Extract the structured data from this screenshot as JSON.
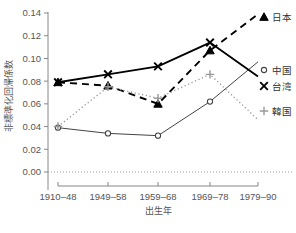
{
  "chart_data": {
    "type": "line",
    "title": "",
    "xlabel": "出生年",
    "ylabel": "非標準化回帰係数",
    "categories": [
      "1910–48",
      "1949–58",
      "1959–68",
      "1969–78",
      "1979–90"
    ],
    "yticks": [
      "0.00",
      "0.02",
      "0.04",
      "0.06",
      "0.08",
      "0.10",
      "0.12",
      "0.14"
    ],
    "ytick_values": [
      0.0,
      0.02,
      0.04,
      0.06,
      0.08,
      0.1,
      0.12,
      0.14
    ],
    "ylim": [
      0.0,
      0.145
    ],
    "grid": false,
    "zero_reference_line": 0.0,
    "legend_position": "right",
    "series": [
      {
        "name": "日本",
        "marker": "triangle",
        "line_style": "dashed",
        "color": "#000000",
        "values": [
          0.079,
          0.076,
          0.06,
          0.107,
          0.139
        ]
      },
      {
        "name": "中国",
        "marker": "circle",
        "line_style": "solid-thin",
        "color": "#444444",
        "values": [
          0.039,
          0.034,
          0.032,
          0.062,
          0.097
        ]
      },
      {
        "name": "台湾",
        "marker": "cross",
        "line_style": "solid-thick",
        "color": "#000000",
        "values": [
          0.079,
          0.086,
          0.093,
          0.114,
          0.084
        ]
      },
      {
        "name": "韓国",
        "marker": "plus",
        "line_style": "dotted",
        "color": "#999999",
        "values": [
          0.04,
          0.075,
          0.065,
          0.086,
          0.046
        ]
      }
    ]
  }
}
